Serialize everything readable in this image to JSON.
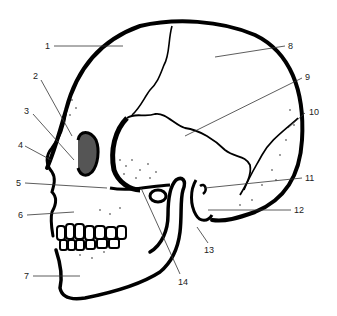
{
  "diagram": {
    "labels": [
      {
        "id": "1",
        "text": "1",
        "x": 45,
        "y": 41,
        "line": [
          54,
          46,
          123,
          46
        ]
      },
      {
        "id": "2",
        "text": "2",
        "x": 33,
        "y": 71,
        "line": [
          41,
          80,
          72,
          136
        ]
      },
      {
        "id": "3",
        "text": "3",
        "x": 24,
        "y": 106,
        "line": [
          33,
          114,
          74,
          160
        ]
      },
      {
        "id": "4",
        "text": "4",
        "x": 18,
        "y": 140,
        "line": [
          25,
          146,
          51,
          160
        ]
      },
      {
        "id": "5",
        "text": "5",
        "x": 16,
        "y": 178,
        "line": [
          25,
          183,
          107,
          188
        ]
      },
      {
        "id": "6",
        "text": "6",
        "x": 18,
        "y": 210,
        "line": [
          27,
          215,
          74,
          212
        ]
      },
      {
        "id": "7",
        "text": "7",
        "x": 24,
        "y": 271,
        "line": [
          33,
          276,
          80,
          276
        ]
      },
      {
        "id": "8",
        "text": "8",
        "x": 288,
        "y": 41,
        "line": [
          215,
          57,
          285,
          46
        ]
      },
      {
        "id": "9",
        "text": "9",
        "x": 305,
        "y": 72,
        "line": [
          185,
          136,
          302,
          78
        ]
      },
      {
        "id": "10",
        "text": "10",
        "x": 309,
        "y": 107,
        "line": [
          288,
          128,
          305,
          113
        ]
      },
      {
        "id": "11",
        "text": "11",
        "x": 305,
        "y": 173,
        "line": [
          205,
          188,
          302,
          178
        ]
      },
      {
        "id": "12",
        "text": "12",
        "x": 294,
        "y": 205,
        "line": [
          208,
          210,
          291,
          210
        ]
      },
      {
        "id": "13",
        "text": "13",
        "x": 204,
        "y": 245,
        "line": [
          197,
          227,
          208,
          243
        ]
      },
      {
        "id": "14",
        "text": "14",
        "x": 178,
        "y": 277,
        "line": [
          141,
          188,
          180,
          274
        ]
      }
    ],
    "colors": {
      "ink": "#000000",
      "leader": "#333333",
      "label_text": "#222222",
      "background": "#ffffff"
    }
  }
}
